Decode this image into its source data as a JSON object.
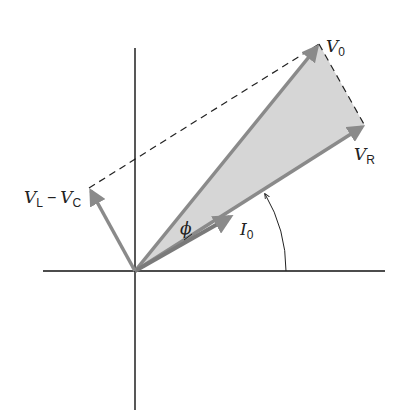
{
  "diagram": {
    "type": "phasor-diagram",
    "colors": {
      "axis": "#111111",
      "vector": "#8a8a8a",
      "triangle_fill": "#d6d6d6",
      "dashed": "#222222",
      "arc": "#222222"
    },
    "origin": {
      "x": 135,
      "y": 271
    },
    "axes": {
      "horizontal": {
        "x1": 43,
        "x2": 385,
        "y": 271
      },
      "vertical": {
        "x": 135,
        "y1": 48,
        "y2": 410
      }
    },
    "vectors": [
      {
        "id": "V0",
        "x": 319,
        "y": 44
      },
      {
        "id": "VR",
        "x": 365,
        "y": 126
      },
      {
        "id": "I0",
        "x": 233,
        "y": 215
      },
      {
        "id": "VL-VC",
        "x": 89,
        "y": 188
      }
    ],
    "labels": {
      "v0": {
        "main": "V",
        "sub": "0"
      },
      "vr": {
        "main": "V",
        "sub": "R"
      },
      "i0": {
        "main": "I",
        "sub": "0"
      },
      "vlvc": {
        "main1": "V",
        "sub1": "L",
        "op": "−",
        "main2": "V",
        "sub2": "C"
      },
      "phi": "ϕ"
    }
  }
}
